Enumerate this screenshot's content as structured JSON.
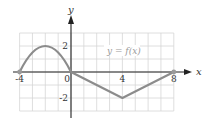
{
  "chart_data": {
    "type": "line",
    "title": "",
    "annotation": "y = f(x)",
    "xlabel": "x",
    "ylabel": "y",
    "xlim": [
      -4,
      8
    ],
    "ylim": [
      -3,
      3
    ],
    "grid": true,
    "grid_step": 1,
    "x_ticks": [
      {
        "value": -4,
        "label": "-4"
      },
      {
        "value": 0,
        "label": "0"
      },
      {
        "value": 4,
        "label": "4"
      },
      {
        "value": 8,
        "label": "8"
      }
    ],
    "y_ticks": [
      {
        "value": 2,
        "label": "2"
      },
      {
        "value": -2,
        "label": "-2"
      }
    ],
    "series": [
      {
        "name": "f(x)",
        "segments": [
          {
            "shape": "curve",
            "points": [
              [
                -4,
                0
              ],
              [
                -2,
                2
              ],
              [
                0,
                0
              ]
            ]
          },
          {
            "shape": "line",
            "points": [
              [
                0,
                0
              ],
              [
                4,
                -2
              ]
            ]
          },
          {
            "shape": "line",
            "points": [
              [
                4,
                -2
              ],
              [
                8,
                0
              ]
            ]
          }
        ],
        "x": [
          -4,
          -3,
          -2,
          -1,
          0,
          4,
          8
        ],
        "y": [
          0,
          1.5,
          2,
          1.5,
          0,
          -2,
          0
        ],
        "endpoints": [
          [
            -4,
            0
          ],
          [
            8,
            0
          ]
        ]
      }
    ],
    "colors": {
      "curve": "#8c8c8c",
      "grid": "#d6d6d6",
      "axis": "#222222",
      "endpoint": "#9a9a9a"
    }
  }
}
